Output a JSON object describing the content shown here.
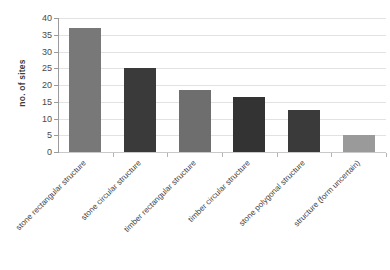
{
  "chart_data": {
    "type": "bar",
    "title": "",
    "xlabel": "",
    "ylabel": "no. of sites",
    "ylim": [
      0,
      40
    ],
    "ytick_step": 5,
    "yticks": [
      0,
      5,
      10,
      15,
      20,
      25,
      30,
      35,
      40
    ],
    "grid": true,
    "legend": "none",
    "categories": [
      "stone rectangular structure",
      "stone circular structure",
      "timber rectangular structure",
      "timber circular structure",
      "stone polygonal structure",
      "structure (form uncertain)"
    ],
    "values": [
      37,
      25,
      18.5,
      16.5,
      12.5,
      5
    ],
    "bar_colors": [
      "#787878",
      "#3a3a3a",
      "#6e6e6e",
      "#333333",
      "#3a3a3a",
      "#9a9a9a"
    ]
  },
  "axes": {
    "y_axis_title": "no. of sites"
  }
}
